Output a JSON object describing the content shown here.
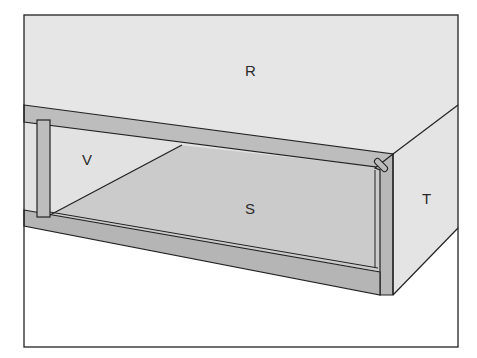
{
  "figure": {
    "labels": {
      "top_surface": "R",
      "left_opening": "V",
      "floor_surface": "S",
      "right_face": "T"
    },
    "caption_partial": "",
    "colors": {
      "light_surface": "#e6e6e6",
      "mid_surface": "#cfcfcf",
      "beam": "#b9b9b9",
      "dark_beam": "#a9a9a9",
      "outline": "#222222",
      "background": "#ffffff"
    }
  }
}
